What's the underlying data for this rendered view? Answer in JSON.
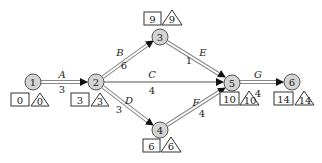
{
  "diagram": {
    "type": "activity-on-arrow network (critical path)",
    "nodes": [
      {
        "id": "1",
        "x": 33,
        "y": 82,
        "early": "0",
        "late": "0"
      },
      {
        "id": "2",
        "x": 96,
        "y": 82,
        "early": "3",
        "late": "3"
      },
      {
        "id": "3",
        "x": 160,
        "y": 37,
        "early": "9",
        "late": "9"
      },
      {
        "id": "4",
        "x": 160,
        "y": 130,
        "early": "6",
        "late": "6"
      },
      {
        "id": "5",
        "x": 232,
        "y": 83,
        "early": "10",
        "late": "10"
      },
      {
        "id": "6",
        "x": 292,
        "y": 82,
        "early": "14",
        "late": "14"
      }
    ],
    "activities": [
      {
        "name": "A",
        "from": "1",
        "to": "2",
        "duration": "3",
        "critical": true
      },
      {
        "name": "B",
        "from": "2",
        "to": "3",
        "duration": "6",
        "critical": true
      },
      {
        "name": "C",
        "from": "2",
        "to": "5",
        "duration": "4",
        "critical": false
      },
      {
        "name": "D",
        "from": "2",
        "to": "4",
        "duration": "3",
        "critical": true
      },
      {
        "name": "E",
        "from": "3",
        "to": "5",
        "duration": "1",
        "critical": true
      },
      {
        "name": "F",
        "from": "4",
        "to": "5",
        "duration": "4",
        "critical": true
      },
      {
        "name": "G",
        "from": "5",
        "to": "6",
        "duration": "4",
        "critical": true
      }
    ],
    "legend_hint": {
      "box": "earliest event time",
      "triangle": "latest event time"
    },
    "colors": {
      "node_fill": "#d4d4d4",
      "critical_arrow": "#888888",
      "arrowhead": "#111111"
    }
  }
}
